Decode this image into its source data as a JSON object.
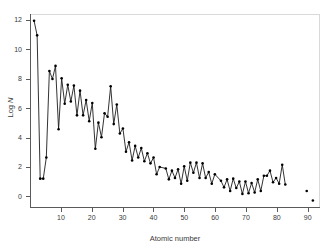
{
  "chart_data": {
    "type": "line",
    "title": "",
    "xlabel": "Atomic number",
    "ylabel": "Log N",
    "ylabel_plain": "Log N",
    "xlim": [
      0,
      94
    ],
    "ylim": [
      -0.8,
      12.4
    ],
    "xticks": [
      10,
      20,
      30,
      40,
      50,
      60,
      70,
      80,
      90
    ],
    "yticks": [
      0,
      2,
      4,
      6,
      8,
      10,
      12
    ],
    "grid": false,
    "legend": null,
    "marker": "filled-circle",
    "line_color": "#1a1a1a",
    "marker_color": "#000000",
    "frame_color": "#d9d9d9",
    "axis_color": "#5a5a5a",
    "series": [
      {
        "name": "connected-abundances",
        "x": [
          1,
          2,
          3,
          4,
          5,
          6,
          7,
          8,
          9,
          10,
          11,
          12,
          13,
          14,
          15,
          16,
          17,
          18,
          19,
          20,
          21,
          22,
          23,
          24,
          25,
          26,
          27,
          28,
          29,
          30,
          31,
          32,
          33,
          34,
          35,
          36,
          37,
          38,
          39,
          40,
          41,
          42,
          44,
          45,
          46,
          47,
          48,
          49,
          50,
          51,
          52,
          53,
          54,
          55,
          56,
          57,
          58,
          59,
          60,
          62,
          63,
          64,
          65,
          66,
          67,
          68,
          69,
          70,
          71,
          72,
          73,
          74,
          75,
          76,
          77,
          78,
          79,
          80,
          81,
          82,
          83
        ],
        "y": [
          12.0,
          11.0,
          1.15,
          1.15,
          2.6,
          8.55,
          8.0,
          8.9,
          4.55,
          8.05,
          6.3,
          7.6,
          6.45,
          7.55,
          5.5,
          7.2,
          5.5,
          6.55,
          5.1,
          6.35,
          3.2,
          5.0,
          4.0,
          5.65,
          5.4,
          7.5,
          4.9,
          6.25,
          4.25,
          4.6,
          3.0,
          3.65,
          2.4,
          3.4,
          2.6,
          3.25,
          2.35,
          2.9,
          2.2,
          2.6,
          1.45,
          1.95,
          1.85,
          1.1,
          1.7,
          1.2,
          1.8,
          0.8,
          2.0,
          1.0,
          2.25,
          1.55,
          2.25,
          1.2,
          2.2,
          1.2,
          1.6,
          0.8,
          1.45,
          1.0,
          0.55,
          1.1,
          0.3,
          1.15,
          0.5,
          0.95,
          0.1,
          0.95,
          0.15,
          0.85,
          0.2,
          1.1,
          0.3,
          1.35,
          1.35,
          1.7,
          0.9,
          1.2,
          0.8,
          2.1,
          0.75
        ],
        "labels": [
          "H",
          "He",
          "Li",
          "Be",
          "B",
          "C",
          "N",
          "O",
          "F",
          "Ne",
          "Na",
          "Mg",
          "Al",
          "Si",
          "P",
          "S",
          "Cl",
          "Ar",
          "K",
          "Ca",
          "Sc",
          "Ti",
          "V",
          "Cr",
          "Mn",
          "Fe",
          "Co",
          "Ni",
          "Cu",
          "Zn",
          "Ga",
          "Ge",
          "As",
          "Se",
          "Br",
          "Kr",
          "Rb",
          "Sr",
          "Y",
          "Zr",
          "Nb",
          "Mo",
          "Ru",
          "Rh",
          "Pd",
          "Ag",
          "Cd",
          "In",
          "Sn",
          "Sb",
          "Te",
          "I",
          "Xe",
          "Cs",
          "Ba",
          "La",
          "Ce",
          "Pr",
          "Nd",
          "Sm",
          "Eu",
          "Gd",
          "Tb",
          "Dy",
          "Ho",
          "Er",
          "Tm",
          "Yb",
          "Lu",
          "Hf",
          "Ta",
          "W",
          "Re",
          "Os",
          "Ir",
          "Pt",
          "Au",
          "Hg",
          "Tl",
          "Pb",
          "Bi"
        ]
      },
      {
        "name": "isolated-actinides",
        "mode": "markers",
        "x": [
          90,
          92
        ],
        "y": [
          0.3,
          -0.35
        ],
        "labels": [
          "Th",
          "U"
        ]
      }
    ],
    "annotations": []
  },
  "axes": {
    "x_title": "Atomic number",
    "y_title_prefix": "Log ",
    "y_title_italic": "N",
    "x_tick_labels": [
      "10",
      "20",
      "30",
      "40",
      "50",
      "60",
      "70",
      "80",
      "90"
    ],
    "y_tick_labels": [
      "0",
      "2",
      "4",
      "6",
      "8",
      "10",
      "12"
    ]
  }
}
